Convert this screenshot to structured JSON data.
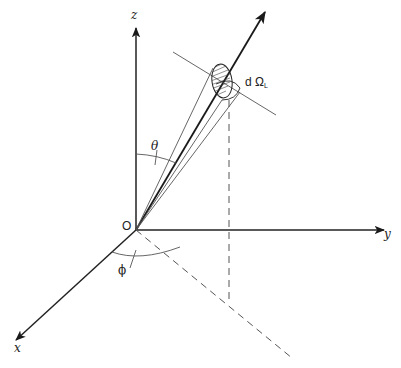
{
  "diagram": {
    "labels": {
      "z_axis": "z",
      "y_axis": "y",
      "x_axis": "x",
      "origin": "O",
      "theta": "θ",
      "phi": "ϕ",
      "solid_angle": "d Ω",
      "solid_angle_subscript": "L"
    },
    "colors": {
      "ink": "#222222",
      "background": "#ffffff"
    }
  }
}
